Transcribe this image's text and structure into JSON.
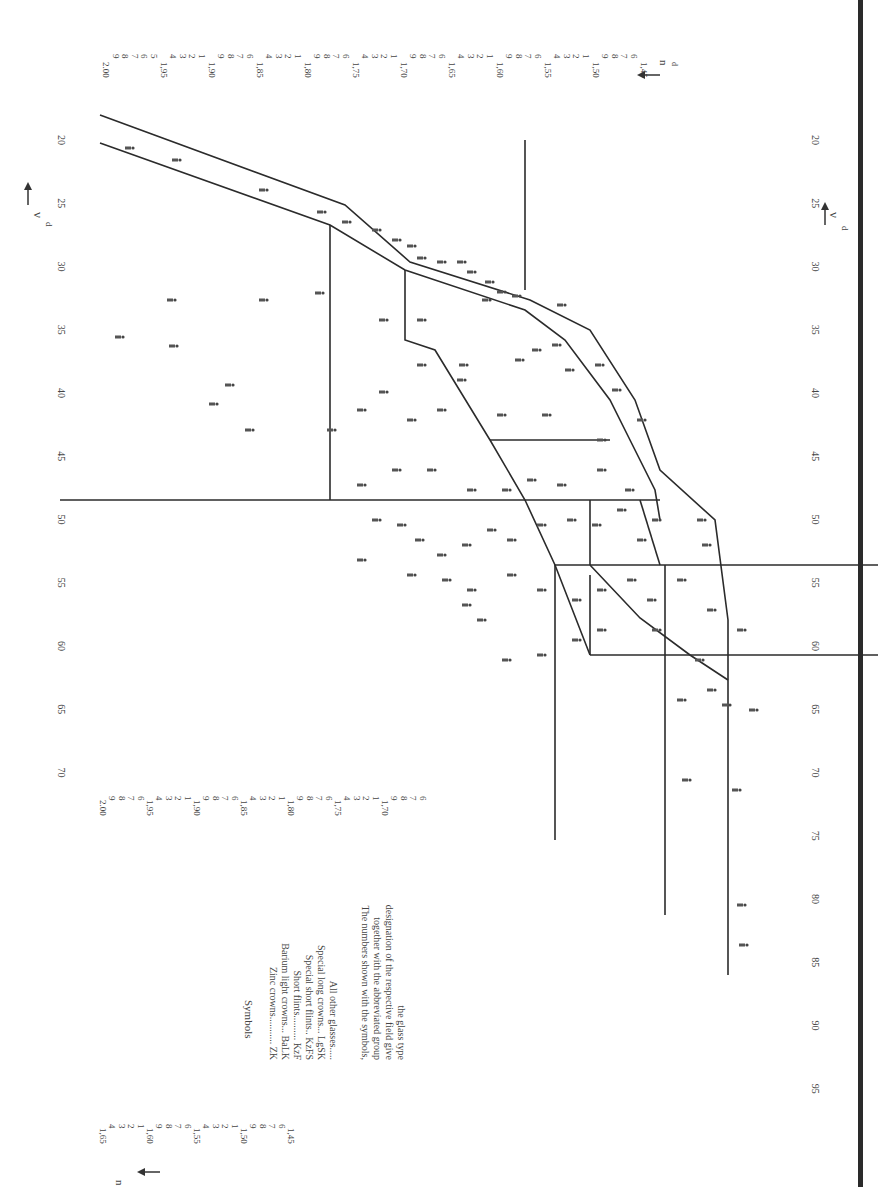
{
  "chart_data": {
    "type": "scatter",
    "orientation": "rotated 90° clockwise (νd runs down the page, nd runs across)",
    "xlabel": "νd",
    "ylabel": "nd",
    "x_axis_arrow": "← νd",
    "y_axis_arrow": "nd ↑",
    "xlim": [
      95,
      18
    ],
    "ylim": [
      1.45,
      2.0
    ],
    "grid": false,
    "x_ticks": [
      20,
      25,
      30,
      35,
      40,
      45,
      50,
      55,
      60,
      65,
      70,
      75,
      80,
      85,
      90,
      95
    ],
    "left_axis_vd_ticks": [
      20,
      25,
      30,
      35,
      40,
      45,
      50,
      55,
      60,
      65,
      70
    ],
    "y_ticks_major": [
      "2.00",
      "1,95",
      "1,90",
      "1,85",
      "1,80",
      "1,75",
      "1,70",
      "1,65",
      "1,60",
      "1,55",
      "1,50",
      "1,45"
    ],
    "y_tick_labels_top": [
      "2.00",
      "9",
      "8",
      "7",
      "6",
      "5",
      "1,95",
      "4",
      "3",
      "2",
      "1",
      "1,90",
      "9",
      "8",
      "7",
      "6",
      "1,85",
      "4",
      "3",
      "2",
      "1",
      "1,80",
      "9",
      "8",
      "7",
      "6",
      "1,75",
      "4",
      "3",
      "2",
      "1",
      "1,70",
      "9",
      "8",
      "7",
      "6",
      "1,65",
      "4",
      "3",
      "2",
      "1",
      "1,60",
      "9",
      "8",
      "7",
      "6",
      "1,55",
      "4",
      "3",
      "2",
      "1",
      "1,50",
      "9",
      "8",
      "7",
      "6",
      "1,45"
    ],
    "y_tick_labels_left_upper": [
      "2.00",
      "9",
      "8",
      "7",
      "6",
      "1,95",
      "4",
      "3",
      "2",
      "1",
      "1,90",
      "9",
      "8",
      "7",
      "6",
      "1,85",
      "4",
      "3",
      "2",
      "1",
      "1,80",
      "9",
      "8",
      "7",
      "6",
      "1,75",
      "4",
      "3",
      "2",
      "1",
      "1,70",
      "9",
      "8",
      "7",
      "6"
    ],
    "y_tick_labels_left_lower": [
      "1,65",
      "4",
      "3",
      "2",
      "1",
      "1,60",
      "9",
      "8",
      "7",
      "6",
      "1,55",
      "4",
      "3",
      "2",
      "1",
      "1,50",
      "9",
      "8",
      "7",
      "6",
      "1,45"
    ],
    "legend": {
      "title": "Symbols",
      "entries": [
        {
          "label": "Zinc crowns",
          "abbr": "ZK"
        },
        {
          "label": "Barium light crowns",
          "abbr": "BaLK"
        },
        {
          "label": "Short flints",
          "abbr": "KzF"
        },
        {
          "label": "Special short flints",
          "abbr": "KzFS"
        },
        {
          "label": "Special long crowns",
          "abbr": "LgSK"
        },
        {
          "label": "All other glasses",
          "abbr": ""
        }
      ],
      "note": "The numbers shown with the symbols, together with the abbreviated group designation of the respective field give the glass type"
    },
    "boundaries": [
      {
        "name": "SF band upper edge",
        "points": [
          [
            18,
            2.0
          ],
          [
            25,
            1.81
          ],
          [
            30,
            1.74
          ],
          [
            35,
            1.67
          ],
          [
            40,
            1.62
          ],
          [
            50,
            1.56
          ],
          [
            55,
            1.54
          ],
          [
            62,
            1.52
          ],
          [
            68,
            1.5
          ]
        ]
      },
      {
        "name": "SF band lower edge",
        "points": [
          [
            20,
            1.99
          ],
          [
            26.5,
            1.8
          ],
          [
            30,
            1.77
          ],
          [
            35,
            1.72
          ],
          [
            40,
            1.65
          ],
          [
            43,
            1.645
          ],
          [
            50,
            1.61
          ],
          [
            55,
            1.54
          ],
          [
            62,
            1.52
          ]
        ]
      },
      {
        "name": "nd 1.80 line",
        "points": [
          [
            26.5,
            1.8
          ],
          [
            50,
            1.8
          ]
        ]
      },
      {
        "name": "vd 50 line",
        "points": [
          [
            50,
            2.0
          ],
          [
            50,
            1.52
          ]
        ]
      },
      {
        "name": "inner boundary",
        "points": [
          [
            30,
            1.74
          ],
          [
            30,
            1.75
          ],
          [
            36,
            1.75
          ],
          [
            43,
            1.72
          ],
          [
            50,
            1.7
          ],
          [
            55,
            1.68
          ],
          [
            62,
            1.67
          ]
        ]
      },
      {
        "name": "vd 43 line",
        "points": [
          [
            43,
            1.72
          ],
          [
            43,
            1.63
          ]
        ]
      },
      {
        "name": "vd 55 line",
        "points": [
          [
            55,
            1.68
          ],
          [
            55,
            1.45
          ]
        ]
      },
      {
        "name": "vd 62 line",
        "points": [
          [
            62,
            1.67
          ],
          [
            62,
            1.45
          ]
        ]
      },
      {
        "name": "nd 1.65 line",
        "points": [
          [
            20,
            1.65
          ],
          [
            33,
            1.65
          ]
        ]
      },
      {
        "name": "nd 1.60 line",
        "points": [
          [
            50,
            1.615
          ],
          [
            55,
            1.615
          ]
        ]
      },
      {
        "name": "nd 1.58 line (to 80)",
        "points": [
          [
            55,
            1.59
          ],
          [
            80,
            1.59
          ]
        ]
      },
      {
        "name": "nd 1.67 line (to 75)",
        "points": [
          [
            62,
            1.67
          ],
          [
            75,
            1.67
          ]
        ]
      },
      {
        "name": "nd 1.51 line (to 85)",
        "points": [
          [
            62,
            1.51
          ],
          [
            85,
            1.51
          ]
        ]
      },
      {
        "name": "diagonal",
        "points": [
          [
            55,
            1.6
          ],
          [
            62,
            1.55
          ],
          [
            68,
            1.51
          ]
        ]
      }
    ],
    "points_approx": [
      {
        "vd": 20.5,
        "nd": 1.93
      },
      {
        "vd": 22,
        "nd": 1.92
      },
      {
        "vd": 24.5,
        "nd": 1.85
      },
      {
        "vd": 26,
        "nd": 1.81
      },
      {
        "vd": 26.5,
        "nd": 1.79
      },
      {
        "vd": 27,
        "nd": 1.77
      },
      {
        "vd": 28,
        "nd": 1.74
      },
      {
        "vd": 28.5,
        "nd": 1.72
      },
      {
        "vd": 29,
        "nd": 1.71
      },
      {
        "vd": 29.5,
        "nd": 1.7
      },
      {
        "vd": 30.5,
        "nd": 1.69
      },
      {
        "vd": 31,
        "nd": 1.7
      },
      {
        "vd": 31.5,
        "nd": 1.67
      },
      {
        "vd": 32,
        "nd": 1.66
      },
      {
        "vd": 33,
        "nd": 1.65
      },
      {
        "vd": 33.5,
        "nd": 1.98
      },
      {
        "vd": 33,
        "nd": 1.87
      },
      {
        "vd": 32.5,
        "nd": 1.81
      },
      {
        "vd": 35,
        "nd": 1.64
      },
      {
        "vd": 36,
        "nd": 1.62
      },
      {
        "vd": 37,
        "nd": 1.58
      },
      {
        "vd": 38,
        "nd": 1.79
      },
      {
        "vd": 38.5,
        "nd": 1.74
      },
      {
        "vd": 39,
        "nd": 1.7
      },
      {
        "vd": 40,
        "nd": 1.67
      },
      {
        "vd": 41,
        "nd": 1.76
      },
      {
        "vd": 42,
        "nd": 1.72
      },
      {
        "vd": 44,
        "nd": 1.64
      },
      {
        "vd": 45,
        "nd": 1.67
      },
      {
        "vd": 46,
        "nd": 1.7
      },
      {
        "vd": 47,
        "nd": 1.62
      },
      {
        "vd": 48,
        "nd": 1.66
      },
      {
        "vd": 49,
        "nd": 1.6
      },
      {
        "vd": 51,
        "nd": 1.6
      },
      {
        "vd": 52,
        "nd": 1.62
      },
      {
        "vd": 53,
        "nd": 1.64
      },
      {
        "vd": 54,
        "nd": 1.74
      },
      {
        "vd": 55,
        "nd": 1.7
      },
      {
        "vd": 56,
        "nd": 1.68
      },
      {
        "vd": 57,
        "nd": 1.65
      },
      {
        "vd": 58,
        "nd": 1.62
      },
      {
        "vd": 59,
        "nd": 1.6
      },
      {
        "vd": 60,
        "nd": 1.57
      },
      {
        "vd": 61,
        "nd": 1.55
      },
      {
        "vd": 63,
        "nd": 1.53
      },
      {
        "vd": 64,
        "nd": 1.6
      },
      {
        "vd": 66,
        "nd": 1.52
      },
      {
        "vd": 67,
        "nd": 1.5
      },
      {
        "vd": 68,
        "nd": 1.56
      },
      {
        "vd": 70,
        "nd": 1.51
      },
      {
        "vd": 82,
        "nd": 1.49
      },
      {
        "vd": 84,
        "nd": 1.49
      }
    ]
  },
  "axes": {
    "vd_arrow_label": "νd",
    "nd_arrow_label": "nd"
  }
}
